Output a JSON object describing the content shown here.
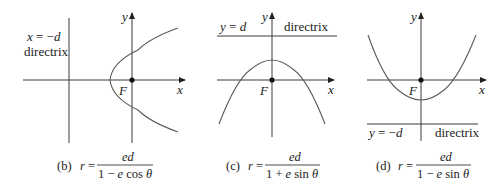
{
  "figure": {
    "panels": [
      {
        "id": "b",
        "caption_tag": "(b)",
        "lhs": "r =",
        "numerator": "ed",
        "denominator": "1 − e cos θ",
        "directrix_equation": "x = −d",
        "directrix_label": "directrix",
        "focus_label": "F",
        "x_axis_label": "x",
        "y_axis_label": "y",
        "opening": "right"
      },
      {
        "id": "c",
        "caption_tag": "(c)",
        "lhs": "r =",
        "numerator": "ed",
        "denominator": "1 + e sin θ",
        "directrix_equation": "y = d",
        "directrix_label": "directrix",
        "focus_label": "F",
        "x_axis_label": "x",
        "y_axis_label": "y",
        "opening": "down"
      },
      {
        "id": "d",
        "caption_tag": "(d)",
        "lhs": "r =",
        "numerator": "ed",
        "denominator": "1 − e sin θ",
        "directrix_equation": "y = −d",
        "directrix_label": "directrix",
        "focus_label": "F",
        "x_axis_label": "x",
        "y_axis_label": "y",
        "opening": "up"
      }
    ]
  }
}
